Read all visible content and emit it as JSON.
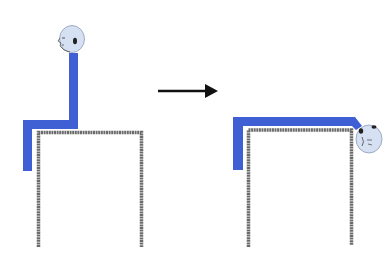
{
  "diagram": {
    "colors": {
      "body": "#3f5fd4",
      "table": "#6b6b6b",
      "head_fill": "#d5e0f2",
      "head_stroke": "#8a9bb8",
      "arrow": "#111111"
    },
    "panels": [
      {
        "name": "before",
        "state": "sitting upright"
      },
      {
        "name": "after",
        "state": "lying supine, head extended over edge"
      }
    ],
    "arrow": {
      "direction": "right"
    }
  }
}
